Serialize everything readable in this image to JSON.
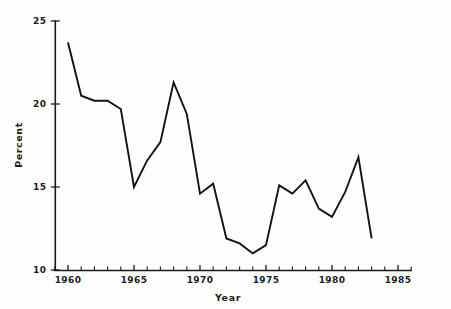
{
  "chart_data": {
    "type": "line",
    "title": "",
    "subtitle": "",
    "xlabel": "Year",
    "ylabel": "Percent",
    "xlim": [
      1959,
      1986
    ],
    "ylim": [
      10,
      25
    ],
    "grid": false,
    "legend": null,
    "x_ticks_major": [
      1960,
      1965,
      1970,
      1975,
      1980,
      1985
    ],
    "x_tick_labels": [
      "1960",
      "1965",
      "1970",
      "1975",
      "1980",
      "1985"
    ],
    "y_ticks": [
      10,
      15,
      20,
      25
    ],
    "y_tick_labels": [
      "10",
      "15",
      "20",
      "25"
    ],
    "x_tick_step_minor": 1,
    "series": [
      {
        "name": "Percent",
        "color": "#121212",
        "x": [
          1960,
          1961,
          1962,
          1963,
          1964,
          1965,
          1966,
          1967,
          1968,
          1969,
          1970,
          1971,
          1972,
          1973,
          1974,
          1975,
          1976,
          1977,
          1978,
          1979,
          1980,
          1981,
          1982,
          1983
        ],
        "values": [
          23.7,
          20.5,
          20.2,
          20.2,
          19.7,
          15.0,
          16.6,
          17.7,
          21.3,
          19.4,
          14.6,
          15.2,
          11.9,
          11.6,
          11.0,
          11.5,
          15.1,
          14.6,
          15.4,
          13.7,
          13.2,
          14.7,
          16.8,
          11.9
        ]
      }
    ]
  },
  "axis": {
    "y_title": "Percent",
    "x_title": "Year"
  }
}
